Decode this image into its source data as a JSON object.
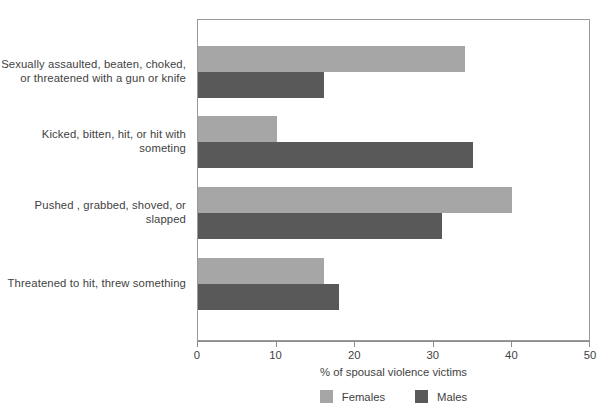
{
  "chart_data": {
    "type": "bar",
    "orientation": "horizontal",
    "title": "",
    "xlabel": "% of spousal violence victims",
    "ylabel": "",
    "xlim": [
      0,
      50
    ],
    "xticks": [
      0,
      10,
      20,
      30,
      40,
      50
    ],
    "grid": false,
    "legend_position": "bottom-center",
    "categories": [
      "Sexually assaulted, beaten, choked, or threatened with a gun or knife",
      "Kicked, bitten, hit, or hit with someting",
      "Pushed , grabbed, shoved, or slapped",
      "Threatened to hit, threw something"
    ],
    "category_lines": [
      [
        "Sexually assaulted, beaten, choked,",
        "or threatened with a gun or knife"
      ],
      [
        "Kicked, bitten, hit, or hit with",
        "someting"
      ],
      [
        "Pushed , grabbed, shoved, or",
        "slapped"
      ],
      [
        "Threatened to hit, threw something"
      ]
    ],
    "series": [
      {
        "name": "Females",
        "color": "#a6a6a6",
        "values": [
          34,
          10,
          40,
          16
        ]
      },
      {
        "name": "Males",
        "color": "#595959",
        "values": [
          16,
          35,
          31,
          18
        ]
      }
    ]
  },
  "axis": {
    "tick_labels": [
      "0",
      "10",
      "20",
      "30",
      "40",
      "50"
    ],
    "x_title": "% of spousal violence victims"
  },
  "legend": {
    "items": [
      {
        "label": "Females",
        "color": "#a6a6a6"
      },
      {
        "label": "Males",
        "color": "#595959"
      }
    ]
  },
  "colors": {
    "females": "#a6a6a6",
    "males": "#595959",
    "axis": "#8c8c8c",
    "text": "#3f3f3f",
    "background": "#ffffff"
  }
}
